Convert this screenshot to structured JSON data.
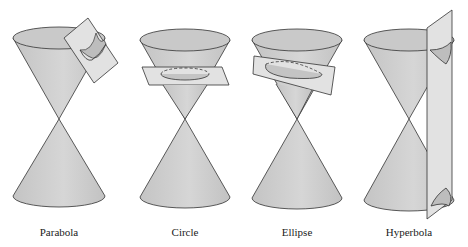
{
  "figure": {
    "fig_label": "",
    "colors": {
      "cone_fill": "#cfcfcf",
      "cone_shade": "#bdbdbd",
      "plane_fill": "#e4e4e4",
      "stroke": "#333333",
      "background": "#ffffff"
    },
    "panels": [
      {
        "id": "parabola",
        "label": "Parabola"
      },
      {
        "id": "circle",
        "label": "Circle"
      },
      {
        "id": "ellipse",
        "label": "Ellipse"
      },
      {
        "id": "hyperbola",
        "label": "Hyperbola"
      }
    ]
  }
}
